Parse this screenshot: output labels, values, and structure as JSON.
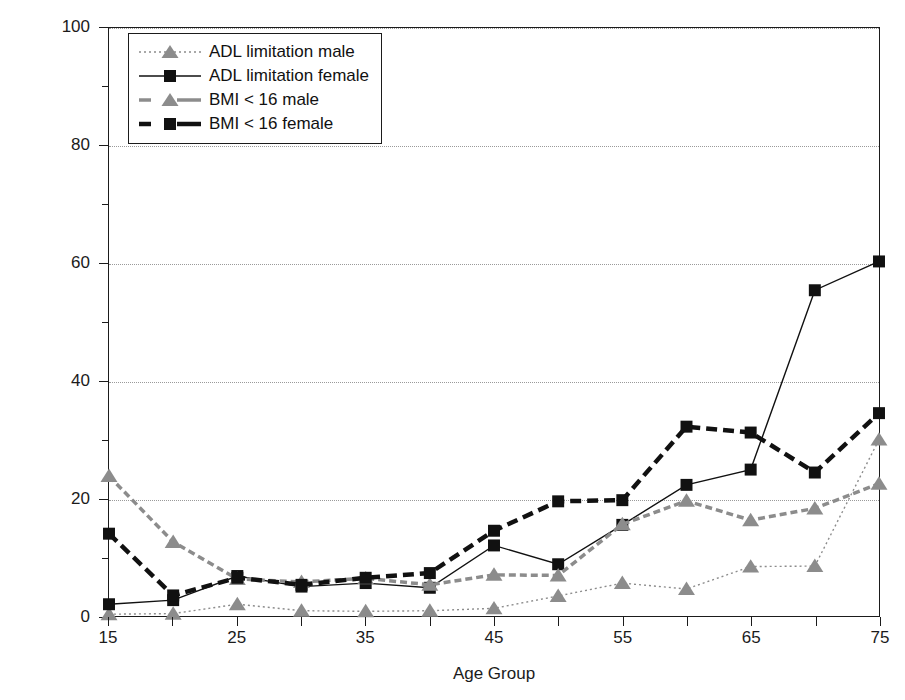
{
  "chart_data": {
    "type": "line",
    "title": "",
    "xlabel": "Age Group",
    "ylabel": "Percentage",
    "xlim": [
      15,
      75
    ],
    "ylim": [
      0,
      100
    ],
    "grid": true,
    "legend_position": "top-left",
    "x": [
      15,
      20,
      25,
      30,
      35,
      40,
      45,
      50,
      55,
      60,
      65,
      70,
      75
    ],
    "xticks": [
      15,
      25,
      35,
      45,
      55,
      65,
      75
    ],
    "xtick_labels": [
      "15",
      "25",
      "35",
      "45",
      "55",
      "65",
      "75"
    ],
    "xminor_ticks": [
      20,
      30,
      40,
      50,
      60,
      70
    ],
    "yticks": [
      0,
      20,
      40,
      60,
      80,
      100
    ],
    "ytick_labels": [
      "0",
      "20",
      "40",
      "60",
      "80",
      "100"
    ],
    "series": [
      {
        "name": "ADL limitation male",
        "marker": "triangle",
        "color": "#8c8c8c",
        "linestyle": "dotted",
        "values": [
          0.3,
          0.4,
          2.0,
          0.9,
          0.8,
          0.9,
          1.3,
          3.4,
          5.6,
          4.6,
          8.4,
          8.5,
          30.0
        ]
      },
      {
        "name": "ADL limitation female",
        "marker": "square",
        "color": "#111111",
        "linestyle": "solid",
        "values": [
          2.0,
          2.7,
          6.8,
          5.0,
          5.6,
          4.8,
          12.0,
          8.8,
          15.5,
          22.3,
          24.9,
          55.4,
          60.3
        ]
      },
      {
        "name": "BMI < 16 male",
        "marker": "triangle",
        "color": "#8c8c8c",
        "linestyle": "dashed",
        "values": [
          23.8,
          12.6,
          6.3,
          5.8,
          6.4,
          5.3,
          7.0,
          6.9,
          15.6,
          19.6,
          16.3,
          18.3,
          22.5
        ]
      },
      {
        "name": "BMI < 16 female",
        "marker": "square",
        "color": "#111111",
        "linestyle": "dashed-bold",
        "values": [
          14.0,
          3.5,
          6.5,
          5.3,
          6.5,
          7.3,
          14.5,
          19.5,
          19.7,
          32.2,
          31.2,
          24.4,
          34.5
        ]
      }
    ]
  }
}
